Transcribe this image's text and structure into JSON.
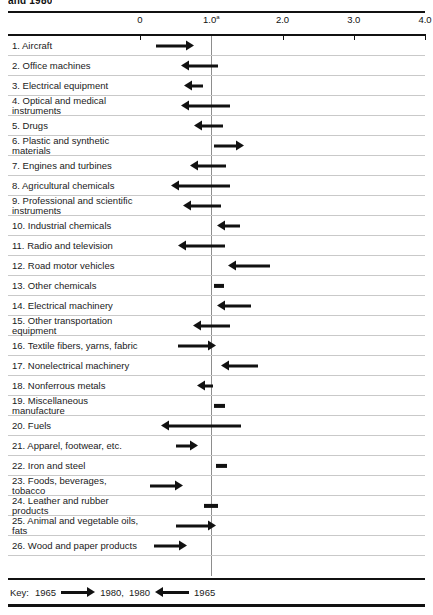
{
  "title_cropped": "and 1980",
  "axis": {
    "ticks": [
      {
        "label": "0",
        "value": 0.0
      },
      {
        "label": "1.0",
        "value": 1.0,
        "superscript": "a"
      },
      {
        "label": "2.0",
        "value": 2.0
      },
      {
        "label": "3.0",
        "value": 3.0
      },
      {
        "label": "4.0",
        "value": 4.0
      }
    ],
    "reference_value": 1.0
  },
  "key": {
    "prefix": "Key:",
    "right_from": "1965",
    "right_to": "1980,",
    "left_from": "1980",
    "left_to": "1965"
  },
  "chart_data": {
    "type": "bar",
    "title": "and 1980",
    "xlabel": "",
    "ylabel": "",
    "xlim": [
      0.0,
      4.0
    ],
    "grid": false,
    "legend": "Key: 1965 → 1980, 1980 ← 1965",
    "annotations": [
      "1.0 reference line marked with footnote a"
    ],
    "categories": [
      "1. Aircraft",
      "2. Office machines",
      "3. Electrical equipment",
      "4. Optical and medical\ninstruments",
      "5. Drugs",
      "6. Plastic and synthetic\nmaterials",
      "7. Engines and turbines",
      "8. Agricultural chemicals",
      "9. Professional and scientific\ninstruments",
      "10. Industrial chemicals",
      "11. Radio and television",
      "12. Road motor vehicles",
      "13. Other chemicals",
      "14. Electrical machinery",
      "15. Other transportation\nequipment",
      "16. Textile fibers, yarns, fabric",
      "17. Nonelectrical machinery",
      "18. Nonferrous metals",
      "19. Miscellaneous\nmanufacture",
      "20. Fuels",
      "21. Apparel, footwear, etc.",
      "22. Iron and steel",
      "23. Foods, beverages,\ntobacco",
      "24. Leather and rubber\nproducts",
      "25. Animal and vegetable oils,\nfats",
      "26. Wood and paper products"
    ],
    "series": [
      {
        "name": "change 1965 to 1980",
        "points": [
          {
            "from": 0.22,
            "to": 0.76,
            "direction": "right"
          },
          {
            "from": 1.1,
            "to": 0.58,
            "direction": "left"
          },
          {
            "from": 0.88,
            "to": 0.62,
            "direction": "left"
          },
          {
            "from": 1.26,
            "to": 0.58,
            "direction": "left"
          },
          {
            "from": 1.16,
            "to": 0.76,
            "direction": "left"
          },
          {
            "from": 1.04,
            "to": 1.46,
            "direction": "right"
          },
          {
            "from": 1.2,
            "to": 0.7,
            "direction": "left"
          },
          {
            "from": 1.26,
            "to": 0.44,
            "direction": "left"
          },
          {
            "from": 1.14,
            "to": 0.6,
            "direction": "left"
          },
          {
            "from": 1.4,
            "to": 1.08,
            "direction": "left"
          },
          {
            "from": 1.2,
            "to": 0.54,
            "direction": "left"
          },
          {
            "from": 1.82,
            "to": 1.24,
            "direction": "left"
          },
          {
            "from": 1.16,
            "to": 1.04,
            "direction": "stub"
          },
          {
            "from": 1.56,
            "to": 1.08,
            "direction": "left"
          },
          {
            "from": 1.26,
            "to": 0.74,
            "direction": "left"
          },
          {
            "from": 0.54,
            "to": 1.06,
            "direction": "right"
          },
          {
            "from": 1.66,
            "to": 1.14,
            "direction": "left"
          },
          {
            "from": 1.02,
            "to": 0.8,
            "direction": "left"
          },
          {
            "from": 1.04,
            "to": 1.2,
            "direction": "stub"
          },
          {
            "from": 1.42,
            "to": 0.3,
            "direction": "left"
          },
          {
            "from": 0.5,
            "to": 0.82,
            "direction": "right"
          },
          {
            "from": 1.06,
            "to": 1.22,
            "direction": "stub"
          },
          {
            "from": 0.14,
            "to": 0.6,
            "direction": "right"
          },
          {
            "from": 0.9,
            "to": 1.1,
            "direction": "stub"
          },
          {
            "from": 0.5,
            "to": 1.06,
            "direction": "right"
          },
          {
            "from": 0.2,
            "to": 0.66,
            "direction": "right"
          }
        ]
      }
    ]
  }
}
